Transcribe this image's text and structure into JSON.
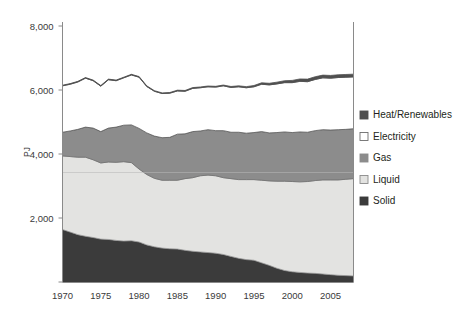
{
  "chart_data": {
    "type": "area",
    "stacked": true,
    "title": "",
    "subtitle": "",
    "xlabel": "",
    "ylabel": "PJ",
    "xlim": [
      1970,
      2008
    ],
    "ylim": [
      0,
      8000
    ],
    "grid": false,
    "legend_position": "right",
    "x_tick_labels": [
      "1970",
      "1975",
      "1980",
      "1985",
      "1990",
      "1995",
      "2000",
      "2005"
    ],
    "x_ticks": [
      1970,
      1975,
      1980,
      1985,
      1990,
      1995,
      2000,
      2005
    ],
    "y_tick_labels": [
      "2,000",
      "4,000",
      "6,000",
      "8,000"
    ],
    "y_ticks": [
      2000,
      4000,
      6000,
      8000
    ],
    "x": [
      1970,
      1971,
      1972,
      1973,
      1974,
      1975,
      1976,
      1977,
      1978,
      1979,
      1980,
      1981,
      1982,
      1983,
      1984,
      1985,
      1986,
      1987,
      1988,
      1989,
      1990,
      1991,
      1992,
      1993,
      1994,
      1995,
      1996,
      1997,
      1998,
      1999,
      2000,
      2001,
      2002,
      2003,
      2004,
      2005,
      2006,
      2007,
      2008
    ],
    "series": [
      {
        "name": "Solid",
        "color": "#3b3b3b",
        "values": [
          1640,
          1560,
          1480,
          1430,
          1390,
          1340,
          1330,
          1300,
          1280,
          1290,
          1250,
          1160,
          1100,
          1060,
          1040,
          1030,
          990,
          960,
          940,
          920,
          900,
          860,
          800,
          740,
          700,
          680,
          600,
          520,
          430,
          360,
          320,
          300,
          280,
          270,
          250,
          230,
          210,
          200,
          190
        ]
      },
      {
        "name": "Liquid",
        "color": "#e3e3e1",
        "values": [
          2300,
          2360,
          2420,
          2470,
          2430,
          2380,
          2420,
          2440,
          2480,
          2440,
          2280,
          2200,
          2140,
          2120,
          2140,
          2150,
          2240,
          2300,
          2380,
          2420,
          2420,
          2400,
          2430,
          2460,
          2500,
          2520,
          2580,
          2640,
          2720,
          2790,
          2820,
          2830,
          2860,
          2900,
          2940,
          2960,
          2980,
          3010,
          3040
        ]
      },
      {
        "name": "Gas",
        "color": "#8c8c8c",
        "values": [
          740,
          800,
          870,
          940,
          990,
          980,
          1060,
          1100,
          1140,
          1180,
          1270,
          1300,
          1320,
          1330,
          1340,
          1440,
          1400,
          1440,
          1400,
          1420,
          1410,
          1470,
          1450,
          1480,
          1450,
          1470,
          1520,
          1500,
          1520,
          1540,
          1530,
          1560,
          1540,
          1560,
          1570,
          1560,
          1570,
          1560,
          1560
        ]
      },
      {
        "name": "Electricity",
        "color": "#ffffff",
        "values": [
          1450,
          1460,
          1480,
          1530,
          1480,
          1420,
          1510,
          1450,
          1480,
          1560,
          1600,
          1450,
          1400,
          1380,
          1380,
          1350,
          1330,
          1350,
          1350,
          1340,
          1360,
          1400,
          1400,
          1420,
          1420,
          1430,
          1480,
          1500,
          1520,
          1540,
          1560,
          1580,
          1580,
          1600,
          1620,
          1620,
          1630,
          1630,
          1620
        ]
      },
      {
        "name": "Heat/Renewables",
        "color": "#4f4f4f",
        "values": [
          20,
          20,
          20,
          20,
          20,
          20,
          20,
          20,
          20,
          20,
          20,
          20,
          20,
          20,
          20,
          25,
          25,
          25,
          25,
          25,
          25,
          25,
          30,
          30,
          35,
          40,
          45,
          50,
          55,
          60,
          70,
          75,
          80,
          85,
          85,
          85,
          85,
          85,
          85
        ]
      }
    ],
    "legend": [
      {
        "label": "Heat/Renewables",
        "color": "#4f4f4f",
        "border": "#4f4f4f"
      },
      {
        "label": "Electricity",
        "color": "#ffffff",
        "border": "#6d6d6d"
      },
      {
        "label": "Gas",
        "color": "#8c8c8c",
        "border": "#8c8c8c"
      },
      {
        "label": "Liquid",
        "color": "#e3e3e1",
        "border": "#8a8a8a"
      },
      {
        "label": "Solid",
        "color": "#3b3b3b",
        "border": "#3b3b3b"
      }
    ]
  }
}
